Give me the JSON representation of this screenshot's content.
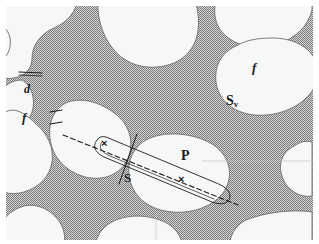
{
  "figure": {
    "kind": "stereology-micrograph-schematic",
    "width": 319,
    "height": 244
  },
  "colors": {
    "background": "#ffffff",
    "light_phase": "#f6f7f7",
    "dark_phase": "#9a9a9a",
    "stipple_light": "#cfcfcf",
    "outline": "#6e6e6e",
    "annotation": "#1b1b1b"
  },
  "labels": [
    {
      "id": "d-neck",
      "text": "d",
      "x": 24,
      "y": 84,
      "kind": "italic-symbol",
      "meaning": "neck diameter measurement"
    },
    {
      "id": "f-left",
      "text": "f",
      "x": 22,
      "y": 112,
      "kind": "italic-symbol",
      "meaning": "volume fraction of phase"
    },
    {
      "id": "f-right",
      "text": "f",
      "x": 252,
      "y": 62,
      "kind": "italic-symbol",
      "meaning": "volume fraction of phase"
    },
    {
      "id": "sv-right",
      "text": "S",
      "sub": "v",
      "x": 226,
      "y": 96,
      "kind": "subscripted-symbol",
      "meaning": "surface area per unit volume"
    },
    {
      "id": "s-center",
      "text": "S",
      "x": 124,
      "y": 172,
      "kind": "symbol",
      "meaning": "intercept segment length"
    },
    {
      "id": "p-right",
      "text": "P",
      "x": 181,
      "y": 150,
      "kind": "symbol",
      "meaning": "test point / probe"
    }
  ],
  "markers": [
    {
      "id": "x-left",
      "glyph": "×",
      "x": 100,
      "y": 138,
      "meaning": "intersection of test line with interface"
    },
    {
      "id": "x-right",
      "glyph": "×",
      "x": 177,
      "y": 174,
      "meaning": "intersection of test line with interface"
    }
  ],
  "annotations": {
    "test_line": {
      "name": "dashed-test-line",
      "style": "dashed",
      "x1": 57,
      "y1": 129,
      "x2": 232,
      "y2": 199
    },
    "neck_line": {
      "name": "neck-diameter-line",
      "style": "solid",
      "x1": 19,
      "y1": 72,
      "x2": 42,
      "y2": 73
    },
    "probe_loop": {
      "name": "elongated-probe-loop",
      "style": "solid-outline",
      "meaning": "narrow cylindrical probe volume drawn around the test line"
    },
    "tick_marks": {
      "name": "intercept-tick-marks",
      "count": 2,
      "meaning": "short bars marking ends of an intercept chord"
    }
  }
}
